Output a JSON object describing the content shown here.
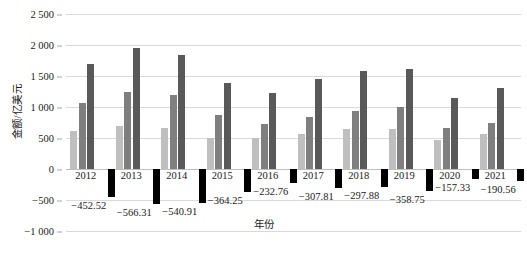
{
  "chart_data": {
    "type": "bar",
    "title": "",
    "xlabel": "年份",
    "ylabel": "金额/亿美元",
    "grid": true,
    "legend": "none",
    "ylim": [
      -1000,
      2500
    ],
    "yticks": [
      2500,
      2000,
      1500,
      1000,
      500,
      0,
      -500,
      -1000
    ],
    "ytick_labels": [
      "2 500",
      "2 000",
      "1 500",
      "1 000",
      "500",
      "0",
      "−500",
      "−1 000"
    ],
    "categories": [
      "2012",
      "2013",
      "2014",
      "2015",
      "2016",
      "2017",
      "2018",
      "2019",
      "2020",
      "2021"
    ],
    "series": [
      {
        "name": "series-1",
        "color": "#bfbfbf",
        "values": [
          610,
          690,
          660,
          500,
          495,
          565,
          640,
          640,
          470,
          560
        ]
      },
      {
        "name": "series-2",
        "color": "#7f7f7f",
        "values": [
          1060,
          1250,
          1200,
          870,
          730,
          840,
          940,
          1000,
          660,
          750
        ]
      },
      {
        "name": "series-3",
        "color": "#595959",
        "values": [
          1690,
          1945,
          1845,
          1390,
          1230,
          1450,
          1580,
          1610,
          1140,
          1300
        ]
      },
      {
        "name": "series-4-negative",
        "color": "#000000",
        "values": [
          -452.52,
          -566.31,
          -540.91,
          -364.25,
          -232.76,
          -307.81,
          -297.88,
          -358.75,
          -157.33,
          -190.56
        ],
        "data_labels": [
          "−452.52",
          "−566.31",
          "−540.91",
          "−364.25",
          "−232.76",
          "−307.81",
          "−297.88",
          "−358.75",
          "−157.33",
          "−190.56"
        ]
      }
    ]
  }
}
